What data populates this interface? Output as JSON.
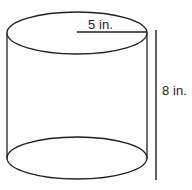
{
  "figure": {
    "kind": "geometry-diagram",
    "shape": "cylinder",
    "background_color": "#ffffff",
    "stroke_color": "#231f20",
    "text_color": "#231f20",
    "labels": {
      "radius": "5 in.",
      "height": "8 in."
    },
    "measurements": [
      {
        "name": "radius",
        "value": 5,
        "unit": "in.",
        "text": "5 in.",
        "orientation": "horizontal"
      },
      {
        "name": "height",
        "value": 8,
        "unit": "in.",
        "text": "8 in.",
        "orientation": "vertical"
      }
    ],
    "geometry": {
      "center_x": 77,
      "ellipse_rx": 70,
      "ellipse_ry": 21,
      "top_ellipse_cy": 33,
      "bottom_ellipse_cy": 158,
      "left_wall_x": 7,
      "right_wall_x": 147,
      "radius_line": {
        "x1": 77,
        "x2": 147,
        "y": 32
      },
      "height_line": {
        "x": 156,
        "y1": 30,
        "y2": 180
      }
    }
  }
}
